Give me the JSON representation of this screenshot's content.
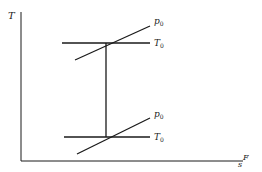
{
  "diagram": {
    "type": "T-s diagram",
    "axes": {
      "y_label": "T",
      "x_label": "s",
      "x_label_superscript": "F"
    },
    "upper_state": {
      "isobar_label": "p",
      "isobar_subscript": "0",
      "isotherm_label": "T",
      "isotherm_subscript": "0"
    },
    "lower_state": {
      "isobar_label": "p",
      "isobar_subscript": "0",
      "isotherm_label": "T",
      "isotherm_subscript": "0"
    },
    "colors": {
      "line": "#1a1a1a",
      "background": "#ffffff"
    }
  }
}
